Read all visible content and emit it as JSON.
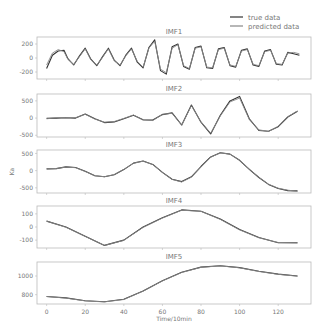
{
  "chart_data": [
    {
      "type": "line",
      "title": "IMF1",
      "xlabel": "",
      "ylabel": "",
      "xlim": [
        -5,
        137
      ],
      "ylim": [
        -300,
        300
      ],
      "yticks": [
        200,
        0,
        -200
      ],
      "ytick_labels": [
        "200",
        "0",
        "-200"
      ],
      "grid": false,
      "series": [
        {
          "name": "true data",
          "x": [
            0,
            3,
            6,
            9,
            11,
            14,
            17,
            20,
            23,
            26,
            29,
            32,
            35,
            38,
            41,
            44,
            47,
            50,
            53,
            56,
            59,
            62,
            65,
            68,
            71,
            74,
            77,
            80,
            83,
            86,
            89,
            92,
            95,
            98,
            101,
            104,
            107,
            110,
            113,
            116,
            119,
            122,
            125,
            128,
            131
          ],
          "values": [
            -150,
            40,
            100,
            110,
            -10,
            -100,
            30,
            140,
            -20,
            -110,
            20,
            140,
            -30,
            -110,
            40,
            140,
            -60,
            -140,
            150,
            260,
            -180,
            -230,
            160,
            200,
            -120,
            -160,
            150,
            170,
            -140,
            -150,
            130,
            150,
            -110,
            -130,
            110,
            130,
            -100,
            -120,
            100,
            120,
            -90,
            -100,
            80,
            60,
            40
          ]
        },
        {
          "name": "predicted data",
          "x": [
            0,
            3,
            6,
            9,
            11,
            14,
            17,
            20,
            23,
            26,
            29,
            32,
            35,
            38,
            41,
            44,
            47,
            50,
            53,
            56,
            59,
            62,
            65,
            68,
            71,
            74,
            77,
            80,
            83,
            86,
            89,
            92,
            95,
            98,
            101,
            104,
            107,
            110,
            113,
            116,
            119,
            122,
            125,
            128,
            131
          ],
          "values": [
            -100,
            70,
            120,
            90,
            -20,
            -90,
            20,
            130,
            -30,
            -100,
            10,
            130,
            -40,
            -100,
            30,
            130,
            -50,
            -130,
            140,
            240,
            -160,
            -210,
            140,
            190,
            -110,
            -150,
            140,
            160,
            -130,
            -140,
            120,
            140,
            -100,
            -120,
            100,
            120,
            -90,
            -110,
            90,
            110,
            -80,
            -90,
            70,
            80,
            60
          ]
        }
      ]
    },
    {
      "type": "line",
      "title": "IMF2",
      "xlabel": "",
      "ylabel": "",
      "xlim": [
        -5,
        137
      ],
      "ylim": [
        -550,
        700
      ],
      "yticks": [
        500,
        0,
        -500
      ],
      "ytick_labels": [
        "500",
        "0",
        "-500"
      ],
      "grid": false,
      "series": [
        {
          "name": "true data",
          "x": [
            0,
            5,
            10,
            15,
            20,
            25,
            30,
            35,
            40,
            45,
            50,
            55,
            60,
            65,
            70,
            75,
            80,
            85,
            90,
            95,
            100,
            105,
            110,
            115,
            120,
            125,
            130
          ],
          "values": [
            -10,
            0,
            10,
            0,
            120,
            -20,
            -130,
            -110,
            -20,
            80,
            -50,
            -60,
            100,
            150,
            -200,
            380,
            -120,
            -460,
            80,
            500,
            630,
            -20,
            -360,
            -380,
            -250,
            30,
            200
          ]
        },
        {
          "name": "predicted data",
          "x": [
            0,
            5,
            10,
            15,
            20,
            25,
            30,
            35,
            40,
            45,
            50,
            55,
            60,
            65,
            70,
            75,
            80,
            85,
            90,
            95,
            100,
            105,
            110,
            115,
            120,
            125,
            130
          ],
          "values": [
            -20,
            10,
            10,
            10,
            110,
            -30,
            -120,
            -100,
            -10,
            90,
            -60,
            -70,
            110,
            140,
            -210,
            360,
            -110,
            -440,
            60,
            470,
            580,
            -40,
            -340,
            -390,
            -240,
            40,
            210
          ]
        }
      ]
    },
    {
      "type": "line",
      "title": "IMF3",
      "xlabel": "",
      "ylabel": "Ka",
      "xlim": [
        -5,
        137
      ],
      "ylim": [
        -650,
        600
      ],
      "yticks": [
        500,
        0,
        -500
      ],
      "ytick_labels": [
        "500",
        "0",
        "-500"
      ],
      "grid": false,
      "series": [
        {
          "name": "true data",
          "x": [
            0,
            5,
            10,
            15,
            20,
            25,
            30,
            35,
            40,
            45,
            50,
            55,
            60,
            65,
            70,
            75,
            80,
            85,
            90,
            95,
            100,
            105,
            110,
            115,
            120,
            125,
            130
          ],
          "values": [
            50,
            60,
            110,
            90,
            -20,
            -150,
            -180,
            -120,
            30,
            220,
            280,
            180,
            -50,
            -250,
            -320,
            -180,
            120,
            400,
            520,
            480,
            300,
            40,
            -200,
            -400,
            -520,
            -580,
            -590
          ]
        },
        {
          "name": "predicted data",
          "x": [
            0,
            5,
            10,
            15,
            20,
            25,
            30,
            35,
            40,
            45,
            50,
            55,
            60,
            65,
            70,
            75,
            80,
            85,
            90,
            95,
            100,
            105,
            110,
            115,
            120,
            125,
            130
          ],
          "values": [
            50,
            60,
            105,
            85,
            -25,
            -150,
            -175,
            -115,
            35,
            215,
            275,
            175,
            -55,
            -255,
            -330,
            -190,
            110,
            390,
            515,
            480,
            300,
            45,
            -195,
            -395,
            -510,
            -570,
            -600
          ]
        }
      ]
    },
    {
      "type": "line",
      "title": "IMF4",
      "xlabel": "",
      "ylabel": "",
      "xlim": [
        -5,
        137
      ],
      "ylim": [
        -160,
        160
      ],
      "yticks": [
        100,
        0,
        -100
      ],
      "ytick_labels": [
        "100",
        "0",
        "-100"
      ],
      "grid": false,
      "series": [
        {
          "name": "true data",
          "x": [
            0,
            10,
            20,
            30,
            40,
            50,
            60,
            70,
            80,
            90,
            100,
            110,
            120,
            130
          ],
          "values": [
            45,
            0,
            -70,
            -140,
            -100,
            0,
            70,
            130,
            120,
            60,
            -20,
            -80,
            -120,
            -120
          ]
        },
        {
          "name": "predicted data",
          "x": [
            0,
            10,
            20,
            30,
            40,
            50,
            60,
            70,
            80,
            90,
            100,
            110,
            120,
            130
          ],
          "values": [
            45,
            -2,
            -72,
            -140,
            -102,
            -3,
            68,
            128,
            120,
            58,
            -22,
            -82,
            -118,
            -122
          ]
        }
      ]
    },
    {
      "type": "line",
      "title": "IMF5",
      "xlabel": "Time/10min",
      "ylabel": "",
      "xlim": [
        -5,
        137
      ],
      "ylim": [
        700,
        1150
      ],
      "yticks": [
        1000,
        800
      ],
      "ytick_labels": [
        "1000",
        "800"
      ],
      "xticks": [
        0,
        20,
        40,
        60,
        80,
        100,
        120
      ],
      "xtick_labels": [
        "0",
        "20",
        "40",
        "60",
        "80",
        "100",
        "120"
      ],
      "grid": false,
      "series": [
        {
          "name": "true data",
          "x": [
            0,
            10,
            20,
            30,
            40,
            50,
            60,
            70,
            80,
            90,
            100,
            110,
            120,
            130
          ],
          "values": [
            780,
            765,
            735,
            725,
            750,
            840,
            950,
            1040,
            1095,
            1110,
            1090,
            1050,
            1020,
            1000
          ]
        },
        {
          "name": "predicted data",
          "x": [
            0,
            10,
            20,
            30,
            40,
            50,
            60,
            70,
            80,
            90,
            100,
            110,
            120,
            130
          ],
          "values": [
            780,
            763,
            733,
            723,
            748,
            838,
            948,
            1038,
            1093,
            1108,
            1088,
            1048,
            1018,
            998
          ]
        }
      ]
    }
  ],
  "legend": {
    "position": "upper right",
    "entries": [
      {
        "label": "true data",
        "color": "#333333"
      },
      {
        "label": "predicted data",
        "color": "#888888"
      }
    ]
  },
  "colors": {
    "true": "#333333",
    "pred": "#888888",
    "axis": "#bbbbbb",
    "text": "#777777"
  }
}
